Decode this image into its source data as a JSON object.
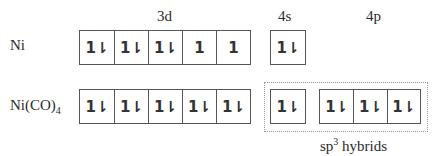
{
  "headers": {
    "d": "3d",
    "s": "4s",
    "p": "4p"
  },
  "rows": [
    {
      "label": "Ni",
      "d": [
        "1l",
        "1l",
        "1l",
        "1",
        "1"
      ],
      "s": [
        "1l"
      ],
      "p": []
    },
    {
      "label_main": "Ni(CO)",
      "label_sub": "4",
      "d": [
        "1l",
        "1l",
        "1l",
        "1l",
        "1l"
      ],
      "s": [
        "1l"
      ],
      "p": [
        "1l",
        "1l",
        "1l"
      ]
    }
  ],
  "hybrid_label": {
    "main": "sp",
    "sup": "3",
    "rest": " hybrids"
  },
  "glyphs": {
    "paired": "1⇂",
    "single": "1"
  }
}
